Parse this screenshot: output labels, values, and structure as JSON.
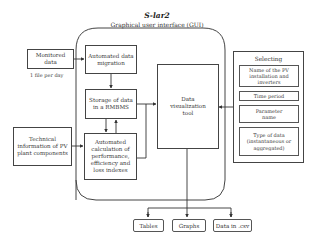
{
  "diagram": {
    "title": "S-lar2",
    "subtitle": "Graphical user interface (GUI)",
    "inputs": {
      "monitored_data": {
        "label": "Monitored data",
        "note": "1 file per day"
      },
      "technical_info": {
        "label": "Technical information of PV plant components"
      }
    },
    "gui_steps": {
      "migration": "Automated data migration",
      "storage": "Storage of data in a RMBMS",
      "calculation": "Automated calculation of performance, efficiency and loss indexes",
      "visualization": "Data visualization tool"
    },
    "selecting": {
      "title": "Selecting",
      "items": [
        "Name of the PV installation and inverters",
        "Time period",
        "Parameter name",
        "Type of data (instantaneous or aggregated)"
      ]
    },
    "outputs": [
      "Tables",
      "Graphs",
      "Data in .csv"
    ],
    "colors": {
      "line": "#444444",
      "background": "#ffffff",
      "text": "#333333"
    }
  }
}
